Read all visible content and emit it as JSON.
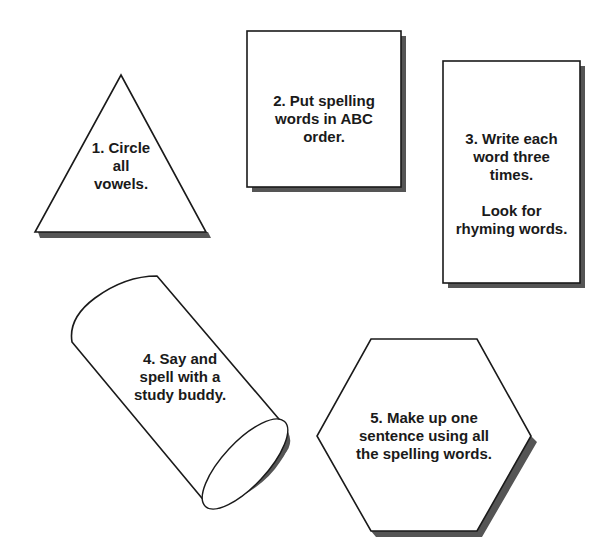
{
  "colors": {
    "background": "#ffffff",
    "outline": "#1a1a1a",
    "shadow": "#555555",
    "fill": "#ffffff"
  },
  "cards": [
    {
      "shape": "triangle",
      "lines": [
        "1. Circle",
        "all",
        "vowels."
      ]
    },
    {
      "shape": "square",
      "lines": [
        "2. Put spelling",
        "words in ABC",
        "order."
      ]
    },
    {
      "shape": "tall-rectangle",
      "lines": [
        "3. Write each",
        "word three",
        "times."
      ],
      "lines2": [
        "Look for",
        "rhyming words."
      ]
    },
    {
      "shape": "cylinder",
      "lines": [
        "4. Say and",
        "spell with a",
        "study buddy."
      ]
    },
    {
      "shape": "hexagon",
      "lines": [
        "5. Make up one",
        "sentence using all",
        "the spelling words."
      ]
    }
  ]
}
